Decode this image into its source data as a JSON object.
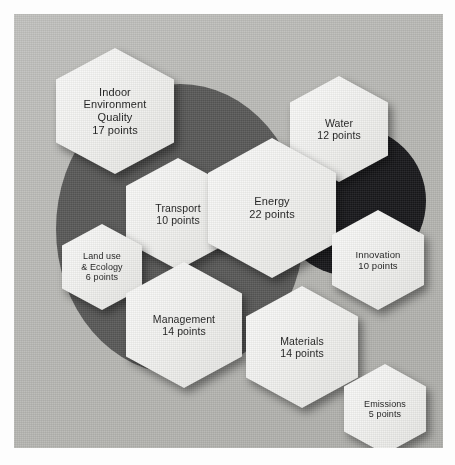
{
  "panel": {
    "background_color": "#b9b9b5",
    "page_background": "#ffffff"
  },
  "background_shapes": [
    {
      "name": "large-gray-circle",
      "color": "#585857"
    },
    {
      "name": "dark-circle",
      "color": "#17171a"
    }
  ],
  "diagram": {
    "hexagon_fill": "#f3f3f1",
    "text_color": "#1b1b1b",
    "nodes": [
      {
        "id": "indoor-environment-quality",
        "lines": [
          "Indoor",
          "Environment",
          "Quality",
          "17 points"
        ],
        "label": "Indoor Environment Quality",
        "points": 17,
        "points_text": "17 points"
      },
      {
        "id": "water",
        "lines": [
          "Water",
          "12 points"
        ],
        "label": "Water",
        "points": 12,
        "points_text": "12 points"
      },
      {
        "id": "transport",
        "lines": [
          "Transport",
          "10 points"
        ],
        "label": "Transport",
        "points": 10,
        "points_text": "10 points"
      },
      {
        "id": "energy",
        "lines": [
          "Energy",
          "22 points"
        ],
        "label": "Energy",
        "points": 22,
        "points_text": "22 points"
      },
      {
        "id": "land-use-and-ecology",
        "lines": [
          "Land use",
          "& Ecology",
          "6 points"
        ],
        "label": "Land use & Ecology",
        "points": 6,
        "points_text": "6 points"
      },
      {
        "id": "innovation",
        "lines": [
          "Innovation",
          "10 points"
        ],
        "label": "Innovation",
        "points": 10,
        "points_text": "10 points"
      },
      {
        "id": "management",
        "lines": [
          "Management",
          "14 points"
        ],
        "label": "Management",
        "points": 14,
        "points_text": "14 points"
      },
      {
        "id": "materials",
        "lines": [
          "Materials",
          "14 points"
        ],
        "label": "Materials",
        "points": 14,
        "points_text": "14 points"
      },
      {
        "id": "emissions",
        "lines": [
          "Emissions",
          "5 points"
        ],
        "label": "Emissions",
        "points": 5,
        "points_text": "5 points"
      }
    ]
  }
}
